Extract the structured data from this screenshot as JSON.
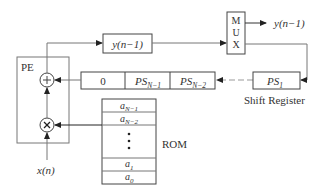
{
  "diagram": {
    "pe_label": "PE",
    "adder_symbol": "+",
    "multiplier_symbol": "×",
    "feedback_register": {
      "text": "y(n−1)",
      "base": "y",
      "arg": "(n−1)"
    },
    "mux_letters": [
      "M",
      "U",
      "X"
    ],
    "output_label": "y(n−1)",
    "shift_register": {
      "cells": [
        {
          "main": "0",
          "sub": ""
        },
        {
          "main": "PS",
          "sub": "N−1"
        },
        {
          "main": "PS",
          "sub": "N−2"
        }
      ],
      "last_cell": {
        "main": "PS",
        "sub": "1"
      },
      "label": "Shift Register"
    },
    "rom": {
      "label": "ROM",
      "rows": [
        {
          "main": "a",
          "sub": "N−1"
        },
        {
          "main": "a",
          "sub": "N−2"
        },
        {
          "main": "⋮",
          "sub": ""
        },
        {
          "main": "a",
          "sub": "1"
        },
        {
          "main": "a",
          "sub": "0"
        }
      ]
    },
    "input_label": "x(n)"
  }
}
